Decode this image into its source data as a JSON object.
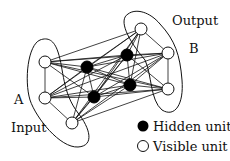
{
  "labels": {
    "input": "Input",
    "output": "Output",
    "group_a": "A",
    "group_b": "B"
  },
  "legend": {
    "hidden": "Hidden unit",
    "visible": "Visible unit"
  },
  "colors": {
    "hidden_fill": "#000000",
    "visible_fill": "#ffffff",
    "stroke": "#111111"
  },
  "nodes": {
    "visible": [
      {
        "id": "a1",
        "x": 45,
        "y": 62
      },
      {
        "id": "a2",
        "x": 45,
        "y": 98
      },
      {
        "id": "a3",
        "x": 72,
        "y": 123
      },
      {
        "id": "b0",
        "x": 141,
        "y": 29
      },
      {
        "id": "b1",
        "x": 168,
        "y": 53
      },
      {
        "id": "b2",
        "x": 168,
        "y": 89
      }
    ],
    "hidden": [
      {
        "id": "h1",
        "x": 87,
        "y": 67
      },
      {
        "id": "h2",
        "x": 127,
        "y": 55
      },
      {
        "id": "h3",
        "x": 94,
        "y": 97
      },
      {
        "id": "h4",
        "x": 130,
        "y": 85
      }
    ]
  }
}
